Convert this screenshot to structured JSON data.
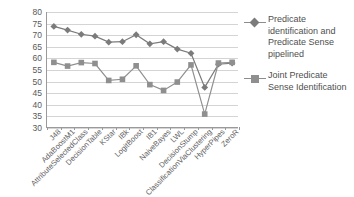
{
  "chart_data": {
    "type": "line",
    "title": "",
    "xlabel": "",
    "ylabel": "",
    "ylim": [
      30,
      80
    ],
    "ytick_step": 5,
    "yticks": [
      80,
      75,
      70,
      65,
      60,
      55,
      50,
      45,
      40,
      35,
      30
    ],
    "grid": true,
    "legend_position": "right",
    "categories": [
      "J48",
      "AdaBoostM1",
      "AttributeSelectedClass",
      "DecisionTable",
      "KStar",
      "IBk",
      "LogitBoost",
      "IB1",
      "NaiveBayes",
      "LWL",
      "DecisionStump",
      "ClassificationViaClustering",
      "HyperPipes",
      "ZeroR"
    ],
    "series": [
      {
        "name": "Predicate identification and Predicate Sense pipelined",
        "marker": "diamond",
        "color": "#7b7b7b",
        "values": [
          73.8,
          72.2,
          70.4,
          69.6,
          67.0,
          67.2,
          70.2,
          66.3,
          67.2,
          64.0,
          62.2,
          47.5,
          57.5,
          58.0
        ]
      },
      {
        "name": "Joint Predicate Sense Identification",
        "marker": "square",
        "color": "#8f8f8f",
        "values": [
          58.3,
          56.7,
          58.2,
          57.8,
          50.5,
          51.0,
          56.8,
          48.7,
          46.2,
          49.8,
          57.2,
          36.0,
          58.0,
          58.3
        ]
      }
    ]
  },
  "legend": {
    "items": [
      {
        "label": "Predicate identification and Predicate Sense pipelined",
        "marker": "diamond-line-icon"
      },
      {
        "label": "Joint Predicate Sense Identification",
        "marker": "square-line-icon"
      }
    ]
  },
  "colors": {
    "series1": "#7b7b7b",
    "series2": "#8f8f8f",
    "grid": "#d4d4d4",
    "axis": "#9a9a9a",
    "text": "#5a5a5a",
    "background": "#ffffff"
  }
}
